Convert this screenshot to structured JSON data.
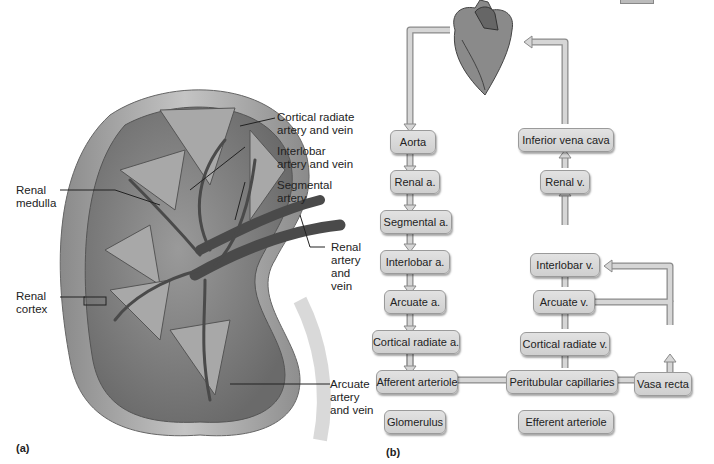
{
  "panel_a": {
    "letter": "(a)",
    "labels": {
      "cortical_radiate": "Cortical radiate\nartery and vein",
      "interlobar": "Interlobar\nartery and vein",
      "segmental": "Segmental\nartery",
      "renal_medulla": "Renal\nmedulla",
      "renal_artery_vein": "Renal\nartery\nand\nvein",
      "renal_cortex": "Renal\ncortex",
      "arcuate": "Arcuate\nartery\nand vein"
    }
  },
  "panel_b": {
    "letter": "(b)",
    "arterial_path": [
      "Aorta",
      "Renal a.",
      "Segmental a.",
      "Interlobar a.",
      "Arcuate a.",
      "Cortical radiate a.",
      "Afferent arteriole",
      "Glomerulus"
    ],
    "venous_path": [
      "Inferior vena cava",
      "Renal v.",
      "Interlobar v.",
      "Arcuate v.",
      "Cortical radiate v.",
      "Peritubular capillaries"
    ],
    "efferent": "Efferent arteriole",
    "vasa_recta": "Vasa recta",
    "colors": {
      "box_fill": "#d8d8d8",
      "box_border": "#9a9a9a",
      "arrow_fill": "#d0d0d0",
      "arrow_stroke": "#8a8a8a"
    }
  }
}
